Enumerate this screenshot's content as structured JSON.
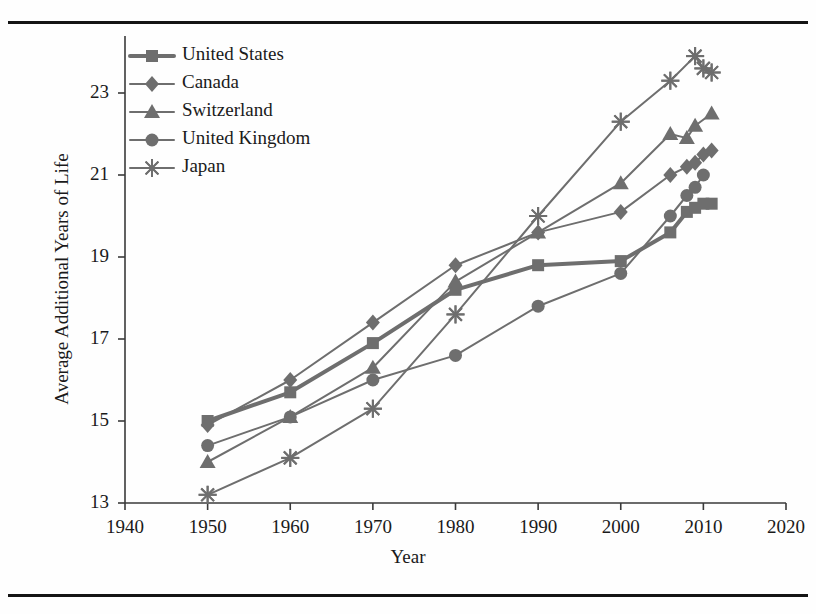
{
  "chart_data": {
    "type": "line",
    "title": "",
    "xlabel": "Year",
    "ylabel": "Average Additional Years of Life",
    "xlim": [
      1940,
      2020
    ],
    "ylim": [
      13,
      24.3
    ],
    "xticks": [
      1940,
      1950,
      1960,
      1970,
      1980,
      1990,
      2000,
      2010,
      2020
    ],
    "yticks": [
      13,
      15,
      17,
      19,
      21,
      23
    ],
    "grid": false,
    "legend_position": "top-left",
    "series": [
      {
        "name": "United States",
        "marker": "square",
        "color": "#6e6e6e",
        "line_width": 4,
        "x": [
          1950,
          1960,
          1970,
          1980,
          1990,
          2000,
          2006,
          2008,
          2009,
          2010,
          2011
        ],
        "values": [
          15.0,
          15.7,
          16.9,
          18.2,
          18.8,
          18.9,
          19.6,
          20.1,
          20.2,
          20.3,
          20.3
        ]
      },
      {
        "name": "Canada",
        "marker": "diamond",
        "color": "#6e6e6e",
        "line_width": 2,
        "x": [
          1950,
          1960,
          1970,
          1980,
          1990,
          2000,
          2006,
          2008,
          2009,
          2010,
          2011
        ],
        "values": [
          14.9,
          16.0,
          17.4,
          18.8,
          19.6,
          20.1,
          21.0,
          21.2,
          21.3,
          21.5,
          21.6
        ]
      },
      {
        "name": "Switzerland",
        "marker": "triangle",
        "color": "#6e6e6e",
        "line_width": 2,
        "x": [
          1950,
          1960,
          1970,
          1980,
          1990,
          2000,
          2006,
          2008,
          2009,
          2011
        ],
        "values": [
          14.0,
          15.1,
          16.3,
          18.4,
          19.6,
          20.8,
          22.0,
          21.9,
          22.2,
          22.5
        ]
      },
      {
        "name": "United Kingdom",
        "marker": "circle",
        "color": "#6e6e6e",
        "line_width": 2,
        "x": [
          1950,
          1960,
          1970,
          1980,
          1990,
          2000,
          2006,
          2008,
          2009,
          2010
        ],
        "values": [
          14.4,
          15.1,
          16.0,
          16.6,
          17.8,
          18.6,
          20.0,
          20.5,
          20.7,
          21.0
        ]
      },
      {
        "name": "Japan",
        "marker": "star",
        "color": "#6e6e6e",
        "line_width": 2,
        "x": [
          1950,
          1960,
          1970,
          1980,
          1990,
          2000,
          2006,
          2009,
          2010,
          2011
        ],
        "values": [
          13.2,
          14.1,
          15.3,
          17.6,
          20.0,
          22.3,
          23.3,
          23.9,
          23.6,
          23.5
        ]
      }
    ]
  },
  "axis": {
    "xlabel": "Year",
    "ylabel": "Average Additional Years of Life",
    "xtick_labels": [
      "1940",
      "1950",
      "1960",
      "1970",
      "1980",
      "1990",
      "2000",
      "2010",
      "2020"
    ],
    "ytick_labels": [
      "13",
      "15",
      "17",
      "19",
      "21",
      "23"
    ]
  },
  "legend": {
    "entries": [
      {
        "label": "United States",
        "marker": "square-marker-icon"
      },
      {
        "label": "Canada",
        "marker": "diamond-marker-icon"
      },
      {
        "label": "Switzerland",
        "marker": "triangle-marker-icon"
      },
      {
        "label": "United Kingdom",
        "marker": "circle-marker-icon"
      },
      {
        "label": "Japan",
        "marker": "star-marker-icon"
      }
    ]
  },
  "colors": {
    "series": "#6e6e6e",
    "axis": "#3a3a3a",
    "text": "#1a1a1a",
    "rule": "#141414"
  }
}
